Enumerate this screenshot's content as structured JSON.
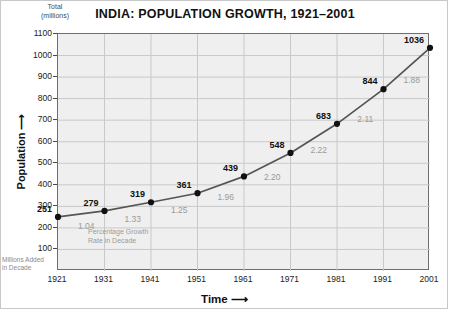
{
  "chart_data": {
    "type": "line",
    "title": "INDIA: POPULATION GROWTH, 1921–2001",
    "unit_label": "Total\n(millions)",
    "unit_label_line1": "Total",
    "unit_label_line2": "(millions)",
    "xlabel": "Time ⟶",
    "ylabel": "Population ⟶",
    "ylim": [
      0,
      1100
    ],
    "xlim": [
      1921,
      2001
    ],
    "grid": true,
    "legend": "none",
    "yticks": [
      100,
      200,
      300,
      400,
      500,
      600,
      700,
      800,
      900,
      1000,
      1100
    ],
    "x": [
      1921,
      1931,
      1941,
      1951,
      1961,
      1971,
      1981,
      1991,
      2001
    ],
    "categories": [
      "1921",
      "1931",
      "1941",
      "1951",
      "1961",
      "1971",
      "1981",
      "1991",
      "2001"
    ],
    "values": [
      251,
      279,
      319,
      361,
      439,
      548,
      683,
      844,
      1036
    ],
    "series": [
      {
        "name": "Total population (millions)",
        "values": [
          251,
          279,
          319,
          361,
          439,
          548,
          683,
          844,
          1036
        ]
      }
    ],
    "annotations": {
      "growth_rate_caption_line1": "Percentage Growth",
      "growth_rate_caption_line2": "Rate in Decade",
      "millions_added_caption_line1": "Millions Added",
      "millions_added_caption_line2": "in Decade",
      "growth_rate_in_decade": [
        "1.04",
        "1.33",
        "1.25",
        "1.96",
        "2.20",
        "2.22",
        "2.11",
        "1.88"
      ],
      "millions_added_in_decade": [
        "+28",
        "+40",
        "+42",
        "+78",
        "+109",
        "+135",
        "+161",
        "+192"
      ],
      "decade_midpoints": [
        1926,
        1936,
        1946,
        1956,
        1966,
        1976,
        1986,
        1996
      ]
    },
    "colors": {
      "line": "#555555",
      "marker": "#111111",
      "plot_background": "#efefef",
      "grid": "#c9c9c9",
      "axis": "#6e6e6e",
      "value_label": "#111111",
      "rate_label": "#9a9a9a",
      "added_label": "#7d7d7d",
      "frame": "#c8c8c8"
    }
  }
}
